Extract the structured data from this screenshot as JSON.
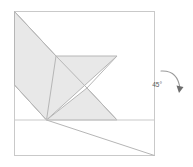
{
  "figure": {
    "title": "",
    "canvas": {
      "width": 193,
      "height": 167
    },
    "frame": {
      "name": "square-sheet-border",
      "x": 14.5,
      "y": 11.5,
      "width": 140,
      "height": 144,
      "stroke": "#c9c9c9",
      "fill": "#ffffff",
      "stroke_width": 1
    },
    "shaded_polygon": {
      "name": "folded-arrow-shape",
      "fill": "#e8e8e8",
      "stroke": "#b6b6b6",
      "stroke_width": 1,
      "points": "14.5,11.5 14.5,85 46.5,120 117,56 56,56"
    },
    "shaded_polygon_lower": {
      "name": "folded-lower-triangle",
      "fill": "#e8e8e8",
      "stroke": "#b6b6b6",
      "stroke_width": 1,
      "points": "46.5,120 117,120 87,88"
    },
    "fold_lines": [
      {
        "name": "fold-line-top-diagonal",
        "x1": 14.5,
        "y1": 11.5,
        "x2": 56,
        "y2": 56,
        "stroke": "#b6b6b6"
      },
      {
        "name": "fold-line-left-diagonal",
        "x1": 14.5,
        "y1": 85,
        "x2": 46.5,
        "y2": 120,
        "stroke": "#b6b6b6"
      },
      {
        "name": "fold-line-crease-vertical",
        "x1": 56,
        "y1": 56,
        "x2": 46.5,
        "y2": 120,
        "stroke": "#b6b6b6"
      },
      {
        "name": "fold-line-notch-upper",
        "x1": 117,
        "y1": 56,
        "x2": 87,
        "y2": 88,
        "stroke": "#b6b6b6"
      },
      {
        "name": "fold-line-notch-lower",
        "x1": 87,
        "y1": 88,
        "x2": 117,
        "y2": 120,
        "stroke": "#b6b6b6"
      },
      {
        "name": "fold-line-horizontal-base",
        "x1": 14.5,
        "y1": 120,
        "x2": 154.5,
        "y2": 120,
        "stroke": "#c9c9c9"
      },
      {
        "name": "fold-line-bottom-diagonal",
        "x1": 46.5,
        "y1": 120,
        "x2": 154.5,
        "y2": 155.5,
        "stroke": "#b6b6b6"
      },
      {
        "name": "fold-line-arrow-tail",
        "x1": 56,
        "y1": 56,
        "x2": 87,
        "y2": 88,
        "stroke": "#b6b6b6"
      }
    ],
    "annotation": {
      "name": "rotation-annotation",
      "angle_label": "45°",
      "label_x": 165,
      "label_y": 85,
      "arrow_color": "#808080",
      "arc_path": "M 161 71 Q 178 70 180 88",
      "arrowhead_points": "177,85 183,87 179,92"
    }
  }
}
